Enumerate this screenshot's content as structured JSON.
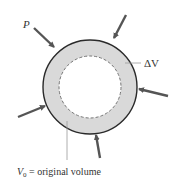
{
  "diagram": {
    "labels": {
      "pressure": "P",
      "delta_v": "ΔV",
      "v0_symbol": "V",
      "v0_subscript": "0",
      "v0_text": " = original volume"
    },
    "colors": {
      "ring_fill": "#d9d9d9",
      "outline": "#2a2a2a",
      "arrow": "#555555",
      "dashed": "#777777",
      "leader": "#999999"
    }
  }
}
